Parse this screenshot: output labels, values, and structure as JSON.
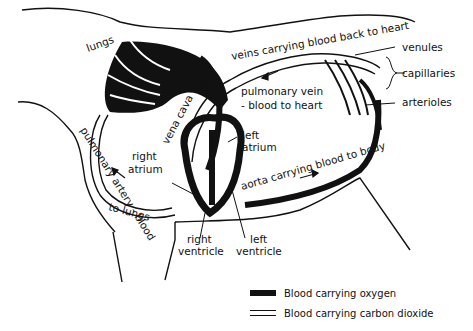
{
  "diagram": {
    "labels": {
      "lungs": "lungs",
      "veins": "veins carrying blood back to heart",
      "venules": "venules",
      "capillaries": "capillaries",
      "arterioles": "arterioles",
      "pulmonary_vein_line1": "pulmonary vein",
      "pulmonary_vein_line2": "- blood to heart",
      "vena_cava": "vena cava",
      "left_atrium_line1": "left",
      "left_atrium_line2": "atrium",
      "right_atrium_line1": "right",
      "right_atrium_line2": "atrium",
      "aorta": "aorta carrying blood to body",
      "pulmonary_artery_line1": "pulmonary artery - blood",
      "pulmonary_artery_line2": "to lungs",
      "right_ventricle_line1": "right",
      "right_ventricle_line2": "ventricle",
      "left_ventricle_line1": "left",
      "left_ventricle_line2": "ventricle"
    }
  },
  "legend": {
    "items": [
      {
        "symbol": "solid-thick-line",
        "label": "Blood carrying oxygen"
      },
      {
        "symbol": "double-line",
        "label": "Blood carrying carbon dioxide"
      }
    ]
  },
  "colors": {
    "ink": "#111111",
    "background": "#ffffff"
  }
}
